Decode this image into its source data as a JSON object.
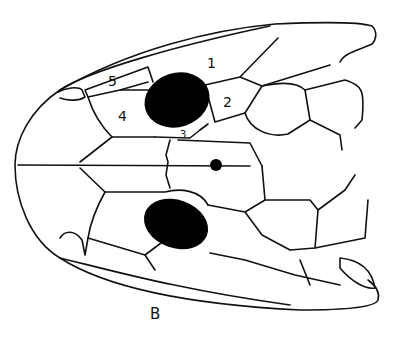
{
  "figure": {
    "caption": "B",
    "scale_labels": [
      "1",
      "2",
      "3",
      "4",
      "5"
    ]
  }
}
